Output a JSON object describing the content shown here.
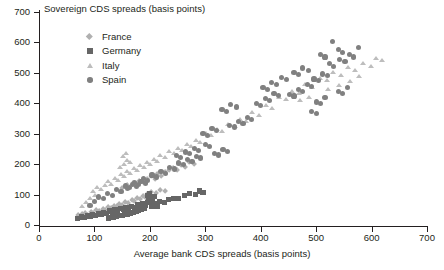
{
  "chart_data": {
    "type": "scatter",
    "title": "",
    "ylabel": "Sovereign CDS spreads (basis points)",
    "xlabel": "Average bank CDS spreads (basis points)",
    "xlim": [
      0,
      700
    ],
    "ylim": [
      0,
      700
    ],
    "xticks": [
      0,
      100,
      200,
      300,
      400,
      500,
      600,
      700
    ],
    "yticks": [
      0,
      100,
      200,
      300,
      400,
      500,
      600,
      700
    ],
    "grid": false,
    "legend_position": "upper-left-inside",
    "series": [
      {
        "name": "France",
        "marker": "diamond",
        "color": "#b0b0b0",
        "points": [
          [
            72,
            30
          ],
          [
            78,
            34
          ],
          [
            84,
            38
          ],
          [
            88,
            30
          ],
          [
            95,
            42
          ],
          [
            99,
            36
          ],
          [
            104,
            46
          ],
          [
            110,
            44
          ],
          [
            116,
            52
          ],
          [
            120,
            48
          ],
          [
            126,
            58
          ],
          [
            131,
            55
          ],
          [
            136,
            62
          ],
          [
            141,
            60
          ],
          [
            146,
            68
          ],
          [
            151,
            64
          ],
          [
            157,
            74
          ],
          [
            162,
            70
          ],
          [
            168,
            80
          ],
          [
            173,
            76
          ],
          [
            178,
            86
          ],
          [
            183,
            82
          ],
          [
            189,
            92
          ],
          [
            194,
            88
          ],
          [
            150,
            120
          ],
          [
            160,
            128
          ],
          [
            170,
            136
          ],
          [
            176,
            132
          ],
          [
            182,
            142
          ],
          [
            188,
            138
          ],
          [
            196,
            150
          ],
          [
            203,
            158
          ],
          [
            210,
            150
          ],
          [
            214,
            166
          ],
          [
            222,
            160
          ],
          [
            228,
            172
          ],
          [
            236,
            178
          ],
          [
            243,
            186
          ],
          [
            250,
            180
          ],
          [
            258,
            196
          ],
          [
            264,
            190
          ],
          [
            272,
            206
          ],
          [
            280,
            200
          ],
          [
            196,
            100
          ],
          [
            204,
            108
          ],
          [
            212,
            104
          ],
          [
            220,
            114
          ],
          [
            228,
            110
          ]
        ]
      },
      {
        "name": "Germany",
        "marker": "square",
        "color": "#666666",
        "points": [
          [
            70,
            22
          ],
          [
            76,
            26
          ],
          [
            82,
            24
          ],
          [
            87,
            30
          ],
          [
            92,
            28
          ],
          [
            97,
            34
          ],
          [
            102,
            30
          ],
          [
            107,
            38
          ],
          [
            112,
            34
          ],
          [
            117,
            42
          ],
          [
            122,
            38
          ],
          [
            127,
            46
          ],
          [
            132,
            42
          ],
          [
            137,
            50
          ],
          [
            142,
            46
          ],
          [
            147,
            54
          ],
          [
            152,
            50
          ],
          [
            157,
            58
          ],
          [
            162,
            54
          ],
          [
            167,
            62
          ],
          [
            172,
            58
          ],
          [
            177,
            66
          ],
          [
            182,
            62
          ],
          [
            187,
            70
          ],
          [
            192,
            66
          ],
          [
            196,
            74
          ],
          [
            190,
            56
          ],
          [
            185,
            52
          ],
          [
            180,
            48
          ],
          [
            175,
            44
          ],
          [
            170,
            40
          ],
          [
            165,
            38
          ],
          [
            160,
            36
          ],
          [
            155,
            34
          ],
          [
            150,
            32
          ],
          [
            145,
            30
          ],
          [
            140,
            28
          ],
          [
            135,
            26
          ],
          [
            130,
            24
          ],
          [
            125,
            22
          ],
          [
            198,
            82
          ],
          [
            200,
            90
          ],
          [
            202,
            78
          ],
          [
            205,
            86
          ],
          [
            208,
            94
          ],
          [
            196,
            98
          ],
          [
            199,
            104
          ],
          [
            212,
            70
          ],
          [
            218,
            76
          ],
          [
            226,
            74
          ],
          [
            234,
            84
          ],
          [
            243,
            88
          ],
          [
            252,
            86
          ],
          [
            262,
            96
          ],
          [
            272,
            104
          ],
          [
            282,
            100
          ],
          [
            290,
            112
          ],
          [
            296,
            108
          ],
          [
            214,
            60
          ],
          [
            204,
            60
          ],
          [
            208,
            66
          ]
        ]
      },
      {
        "name": "Italy",
        "marker": "triangle",
        "color": "#bdbdbd",
        "points": [
          [
            76,
            60
          ],
          [
            84,
            74
          ],
          [
            92,
            86
          ],
          [
            96,
            110
          ],
          [
            100,
            98
          ],
          [
            104,
            122
          ],
          [
            112,
            116
          ],
          [
            118,
            130
          ],
          [
            124,
            142
          ],
          [
            130,
            134
          ],
          [
            136,
            152
          ],
          [
            142,
            146
          ],
          [
            148,
            166
          ],
          [
            152,
            158
          ],
          [
            158,
            176
          ],
          [
            164,
            170
          ],
          [
            170,
            186
          ],
          [
            176,
            180
          ],
          [
            182,
            196
          ],
          [
            188,
            190
          ],
          [
            194,
            206
          ],
          [
            200,
            200
          ],
          [
            146,
            190
          ],
          [
            152,
            200
          ],
          [
            158,
            212
          ],
          [
            164,
            206
          ],
          [
            150,
            226
          ],
          [
            156,
            236
          ],
          [
            206,
            216
          ],
          [
            212,
            210
          ],
          [
            218,
            228
          ],
          [
            226,
            222
          ],
          [
            234,
            240
          ],
          [
            242,
            234
          ],
          [
            250,
            252
          ],
          [
            258,
            246
          ],
          [
            266,
            264
          ],
          [
            274,
            258
          ],
          [
            282,
            276
          ],
          [
            290,
            270
          ],
          [
            300,
            300
          ],
          [
            310,
            294
          ],
          [
            320,
            312
          ],
          [
            330,
            306
          ],
          [
            340,
            330
          ],
          [
            352,
            322
          ],
          [
            362,
            348
          ],
          [
            372,
            340
          ],
          [
            384,
            368
          ],
          [
            396,
            360
          ],
          [
            408,
            392
          ],
          [
            420,
            384
          ],
          [
            432,
            420
          ],
          [
            444,
            412
          ],
          [
            456,
            440
          ],
          [
            468,
            432
          ],
          [
            480,
            460
          ],
          [
            492,
            452
          ],
          [
            506,
            482
          ],
          [
            518,
            474
          ],
          [
            530,
            500
          ],
          [
            544,
            492
          ],
          [
            556,
            516
          ],
          [
            570,
            508
          ],
          [
            584,
            530
          ],
          [
            598,
            522
          ],
          [
            608,
            548
          ],
          [
            618,
            540
          ],
          [
            470,
            408
          ],
          [
            486,
            420
          ],
          [
            520,
            446
          ],
          [
            540,
            458
          ],
          [
            560,
            470
          ],
          [
            576,
            488
          ]
        ]
      },
      {
        "name": "Spain",
        "marker": "circle",
        "color": "#808080",
        "points": [
          [
            92,
            64
          ],
          [
            100,
            78
          ],
          [
            108,
            92
          ],
          [
            116,
            86
          ],
          [
            124,
            104
          ],
          [
            132,
            98
          ],
          [
            140,
            116
          ],
          [
            148,
            110
          ],
          [
            156,
            128
          ],
          [
            164,
            122
          ],
          [
            172,
            140
          ],
          [
            180,
            134
          ],
          [
            188,
            152
          ],
          [
            196,
            146
          ],
          [
            204,
            164
          ],
          [
            212,
            158
          ],
          [
            220,
            176
          ],
          [
            228,
            170
          ],
          [
            236,
            190
          ],
          [
            244,
            184
          ],
          [
            252,
            204
          ],
          [
            260,
            198
          ],
          [
            160,
            120
          ],
          [
            168,
            132
          ],
          [
            176,
            126
          ],
          [
            184,
            144
          ],
          [
            192,
            138
          ],
          [
            248,
            228
          ],
          [
            256,
            222
          ],
          [
            264,
            240
          ],
          [
            272,
            234
          ],
          [
            280,
            252
          ],
          [
            288,
            246
          ],
          [
            268,
            214
          ],
          [
            276,
            208
          ],
          [
            284,
            226
          ],
          [
            292,
            220
          ],
          [
            300,
            264
          ],
          [
            308,
            258
          ],
          [
            296,
            300
          ],
          [
            304,
            294
          ],
          [
            312,
            316
          ],
          [
            320,
            310
          ],
          [
            316,
            236
          ],
          [
            324,
            230
          ],
          [
            332,
            248
          ],
          [
            340,
            242
          ],
          [
            344,
            328
          ],
          [
            352,
            322
          ],
          [
            360,
            340
          ],
          [
            368,
            334
          ],
          [
            376,
            352
          ],
          [
            384,
            346
          ],
          [
            330,
            380
          ],
          [
            338,
            372
          ],
          [
            346,
            396
          ],
          [
            356,
            388
          ],
          [
            392,
            400
          ],
          [
            400,
            394
          ],
          [
            408,
            416
          ],
          [
            416,
            410
          ],
          [
            424,
            432
          ],
          [
            432,
            426
          ],
          [
            404,
            452
          ],
          [
            412,
            446
          ],
          [
            420,
            468
          ],
          [
            428,
            462
          ],
          [
            438,
            484
          ],
          [
            446,
            478
          ],
          [
            452,
            430
          ],
          [
            460,
            424
          ],
          [
            468,
            446
          ],
          [
            476,
            440
          ],
          [
            484,
            462
          ],
          [
            492,
            456
          ],
          [
            460,
            500
          ],
          [
            468,
            494
          ],
          [
            476,
            516
          ],
          [
            486,
            508
          ],
          [
            496,
            480
          ],
          [
            504,
            474
          ],
          [
            512,
            496
          ],
          [
            520,
            490
          ],
          [
            508,
            560
          ],
          [
            516,
            552
          ],
          [
            530,
            604
          ],
          [
            540,
            576
          ],
          [
            548,
            568
          ],
          [
            524,
            530
          ],
          [
            532,
            522
          ],
          [
            542,
            544
          ],
          [
            552,
            536
          ],
          [
            560,
            560
          ],
          [
            568,
            552
          ],
          [
            576,
            582
          ],
          [
            540,
            440
          ],
          [
            548,
            432
          ],
          [
            556,
            452
          ],
          [
            500,
            404
          ],
          [
            508,
            398
          ],
          [
            516,
            420
          ],
          [
            492,
            372
          ],
          [
            500,
            366
          ]
        ]
      }
    ]
  },
  "legend": {
    "items": [
      {
        "label": "France"
      },
      {
        "label": "Germany"
      },
      {
        "label": "Italy"
      },
      {
        "label": "Spain"
      }
    ]
  },
  "axes": {
    "y_tick_labels": [
      "700",
      "600",
      "500",
      "400",
      "300",
      "200",
      "100",
      "0"
    ],
    "x_tick_labels": [
      "0",
      "100",
      "200",
      "300",
      "400",
      "500",
      "600",
      "700"
    ]
  }
}
